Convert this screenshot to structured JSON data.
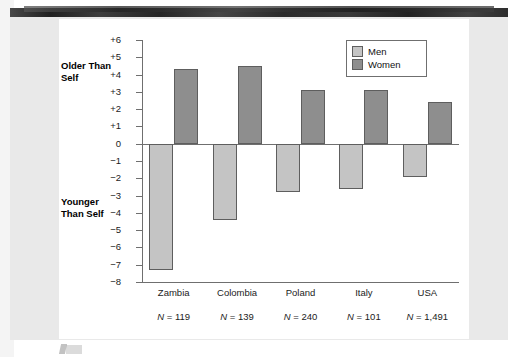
{
  "figure": {
    "left_notes": {
      "older": "Older\nThan\nSelf",
      "younger": "Younger\nThan\nSelf"
    },
    "legend": {
      "men_label": "Men",
      "women_label": "Women"
    },
    "colors": {
      "men_fill": "#c4c4c4",
      "women_fill": "#8e8e8e",
      "bar_stroke": "#5e5e5e",
      "axis": "#6f6f6f",
      "plate": "#ffffff",
      "page_gray": "#e9e9e9"
    }
  },
  "chart_data": {
    "type": "bar",
    "title": "",
    "subtitle": "",
    "xlabel": "",
    "ylabel": "",
    "ylim": [
      -8,
      6
    ],
    "yticks": [
      6,
      5,
      4,
      3,
      2,
      1,
      0,
      -1,
      -2,
      -3,
      -4,
      -5,
      -6,
      -7,
      -8
    ],
    "ytick_labels": [
      "+6",
      "+5",
      "+4",
      "+3",
      "+2",
      "+1",
      "0",
      "−1",
      "−2",
      "−3",
      "−4",
      "−5",
      "−6",
      "−7",
      "−8"
    ],
    "grid": false,
    "legend_position": "top-right",
    "categories": [
      "Zambia",
      "Colombia",
      "Poland",
      "Italy",
      "USA"
    ],
    "sample_sizes": [
      "N = 119",
      "N = 139",
      "N = 240",
      "N = 101",
      "N = 1,491"
    ],
    "sample_size_values": [
      119,
      139,
      240,
      101,
      1491
    ],
    "series": [
      {
        "name": "Men",
        "values": [
          -7.3,
          -4.4,
          -2.8,
          -2.6,
          -1.9
        ]
      },
      {
        "name": "Women",
        "values": [
          4.3,
          4.5,
          3.1,
          3.1,
          2.4
        ]
      }
    ],
    "annotations": [
      {
        "text": "Older Than Self",
        "position": "y-axis-upper"
      },
      {
        "text": "Younger Than Self",
        "position": "y-axis-lower"
      }
    ]
  }
}
